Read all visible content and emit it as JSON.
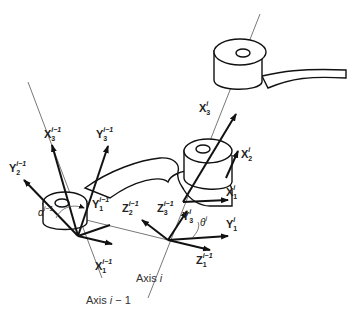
{
  "diagram": {
    "type": "Denavit-Hartenberg robot link frames",
    "axes": [
      {
        "label": "Axis i − 1",
        "base": "Axis",
        "var": "i − 1"
      },
      {
        "label": "Axis i",
        "base": "Axis",
        "var": "i"
      }
    ],
    "frame_labels": [
      {
        "id": "X3_im1",
        "base": "X",
        "sub": "3",
        "sup": "i−1"
      },
      {
        "id": "Y3_im1",
        "base": "Y",
        "sub": "3",
        "sup": "i−1"
      },
      {
        "id": "Y2_im1",
        "base": "Y",
        "sub": "2",
        "sup": "i−1"
      },
      {
        "id": "Y1_im1",
        "base": "Y",
        "sub": "1",
        "sup": "i−1"
      },
      {
        "id": "X1_im1",
        "base": "X",
        "sub": "1",
        "sup": "i−1"
      },
      {
        "id": "Z2_im1",
        "base": "Z",
        "sub": "2",
        "sup": "i−1"
      },
      {
        "id": "Z3_im1",
        "base": "Z",
        "sub": "3",
        "sup": "i−1"
      },
      {
        "id": "Z1_im1",
        "base": "Z",
        "sub": "1",
        "sup": "i−1"
      },
      {
        "id": "Y3_i",
        "base": "Y",
        "sub": "3",
        "sup": "i"
      },
      {
        "id": "Y1_i",
        "base": "Y",
        "sub": "1",
        "sup": "i"
      },
      {
        "id": "X1_i",
        "base": "X",
        "sub": "1",
        "sup": "i"
      },
      {
        "id": "X2_i",
        "base": "X",
        "sub": "2",
        "sup": "i"
      },
      {
        "id": "X3_i",
        "base": "X",
        "sub": "3",
        "sup": "i"
      }
    ],
    "angles": [
      {
        "id": "alpha",
        "symbol": "α",
        "sup": "i−1"
      },
      {
        "id": "theta",
        "symbol": "θ",
        "sup": "i"
      }
    ]
  }
}
